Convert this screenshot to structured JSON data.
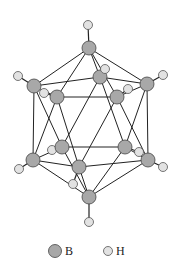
{
  "figure": {
    "colors": {
      "boron": "#a8a8a8",
      "hydrogen": "#e2e2e2",
      "bond": "#222222"
    }
  },
  "atoms": {
    "B": [
      {
        "id": "B1",
        "x": 89,
        "y": 48
      },
      {
        "id": "B2",
        "x": 34,
        "y": 86
      },
      {
        "id": "B3",
        "x": 100,
        "y": 77
      },
      {
        "id": "B4",
        "x": 147,
        "y": 84
      },
      {
        "id": "B5",
        "x": 57,
        "y": 97
      },
      {
        "id": "B6",
        "x": 117,
        "y": 97
      },
      {
        "id": "B7",
        "x": 62,
        "y": 147
      },
      {
        "id": "B8",
        "x": 125,
        "y": 147
      },
      {
        "id": "B9",
        "x": 33,
        "y": 160
      },
      {
        "id": "B10",
        "x": 148,
        "y": 160
      },
      {
        "id": "B11",
        "x": 79,
        "y": 167
      },
      {
        "id": "B12",
        "x": 89,
        "y": 197
      }
    ],
    "H": [
      {
        "id": "H1",
        "x": 88,
        "y": 25
      },
      {
        "id": "H2",
        "x": 18,
        "y": 76
      },
      {
        "id": "H3",
        "x": 105,
        "y": 69
      },
      {
        "id": "H4",
        "x": 163,
        "y": 75
      },
      {
        "id": "H5",
        "x": 44,
        "y": 93
      },
      {
        "id": "H6",
        "x": 128,
        "y": 89
      },
      {
        "id": "H7",
        "x": 52,
        "y": 150
      },
      {
        "id": "H8",
        "x": 139,
        "y": 152
      },
      {
        "id": "H9",
        "x": 19,
        "y": 169
      },
      {
        "id": "H10",
        "x": 163,
        "y": 167
      },
      {
        "id": "H11",
        "x": 73,
        "y": 184
      },
      {
        "id": "H12",
        "x": 89,
        "y": 222
      }
    ]
  },
  "legend": {
    "items": [
      {
        "symbol": "B",
        "label": "B"
      },
      {
        "symbol": "H",
        "label": "H"
      }
    ]
  }
}
